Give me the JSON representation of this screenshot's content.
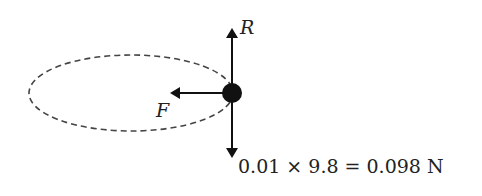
{
  "diagram": {
    "orbit": {
      "style": "dashed",
      "shape": "ellipse"
    },
    "mass": {
      "shape": "filled-circle"
    },
    "forces": [
      {
        "name": "reaction",
        "label": "R",
        "direction": "up"
      },
      {
        "name": "centripetal",
        "label": "F",
        "direction": "left"
      },
      {
        "name": "weight",
        "label": "0.01 × 9.8 = 0.098 N",
        "direction": "down"
      }
    ],
    "colors": {
      "ink": "#111111",
      "dash": "#444444"
    }
  }
}
